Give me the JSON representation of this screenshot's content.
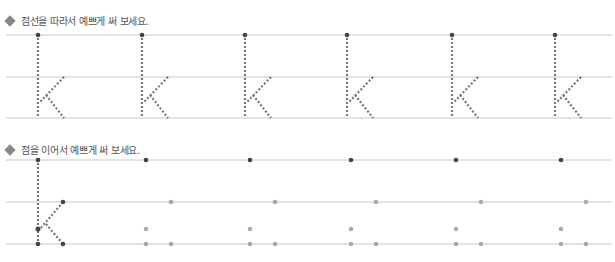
{
  "section1": {
    "instruction": "점선을 따라서 예쁘게 써 보세요.",
    "letter": "k",
    "lines_y": [
      35,
      77,
      118
    ],
    "letter_x": [
      38,
      142,
      245,
      347,
      452,
      555
    ]
  },
  "section2": {
    "instruction": "점을 이어서 예쁘게 써 보세요.",
    "letter": "k",
    "lines_y": [
      160,
      202,
      244
    ],
    "slot_x": [
      38,
      146,
      250,
      351,
      456,
      561
    ]
  },
  "colors": {
    "line": "#c8c8c8",
    "dot_dark": "#444444",
    "dot_light": "#aaaaaa",
    "dotted": "#777777"
  }
}
